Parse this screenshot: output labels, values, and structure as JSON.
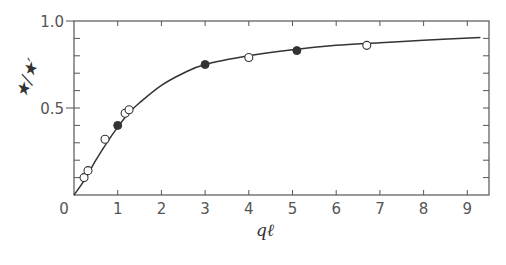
{
  "chart_data": {
    "type": "scatter",
    "title": "",
    "xlabel": "qℓ",
    "ylabel": "★/★′",
    "xlim": [
      0,
      9.5
    ],
    "ylim": [
      0,
      1.0
    ],
    "x_ticks": [
      0,
      1,
      2,
      3,
      4,
      5,
      6,
      7,
      8,
      9
    ],
    "y_ticks_labeled": [
      0,
      0.5,
      1.0
    ],
    "y_tick_labels": [
      "0",
      "0.5",
      "1.0"
    ],
    "x_tick_labels": [
      "0",
      "1",
      "2",
      "3",
      "4",
      "5",
      "6",
      "7",
      "8",
      "9"
    ],
    "y_minor_step": 0.1,
    "grid": false,
    "legend": null,
    "series": [
      {
        "name": "open circles",
        "marker": "open-circle",
        "points": [
          {
            "x": 0.23,
            "y": 0.1
          },
          {
            "x": 0.32,
            "y": 0.14
          },
          {
            "x": 0.71,
            "y": 0.32
          },
          {
            "x": 1.17,
            "y": 0.47
          },
          {
            "x": 1.26,
            "y": 0.49
          },
          {
            "x": 4.0,
            "y": 0.79
          },
          {
            "x": 6.7,
            "y": 0.86
          }
        ]
      },
      {
        "name": "filled circles",
        "marker": "filled-circle",
        "points": [
          {
            "x": 1.0,
            "y": 0.4
          },
          {
            "x": 3.0,
            "y": 0.75
          },
          {
            "x": 5.1,
            "y": 0.83
          }
        ]
      },
      {
        "name": "theory curve",
        "marker": "line",
        "description": "smooth saturating curve from origin to ~0.91 at qℓ≈9.3",
        "points": [
          {
            "x": 0.0,
            "y": 0.0
          },
          {
            "x": 0.25,
            "y": 0.09
          },
          {
            "x": 0.5,
            "y": 0.2
          },
          {
            "x": 0.75,
            "y": 0.3
          },
          {
            "x": 1.0,
            "y": 0.39
          },
          {
            "x": 1.25,
            "y": 0.47
          },
          {
            "x": 1.5,
            "y": 0.53
          },
          {
            "x": 2.0,
            "y": 0.63
          },
          {
            "x": 2.5,
            "y": 0.7
          },
          {
            "x": 3.0,
            "y": 0.75
          },
          {
            "x": 4.0,
            "y": 0.8
          },
          {
            "x": 5.0,
            "y": 0.835
          },
          {
            "x": 6.0,
            "y": 0.86
          },
          {
            "x": 7.0,
            "y": 0.875
          },
          {
            "x": 8.0,
            "y": 0.89
          },
          {
            "x": 9.3,
            "y": 0.905
          }
        ]
      }
    ]
  },
  "colors": {
    "ink": "#333333",
    "axis": "#555555",
    "background": "#ffffff"
  }
}
